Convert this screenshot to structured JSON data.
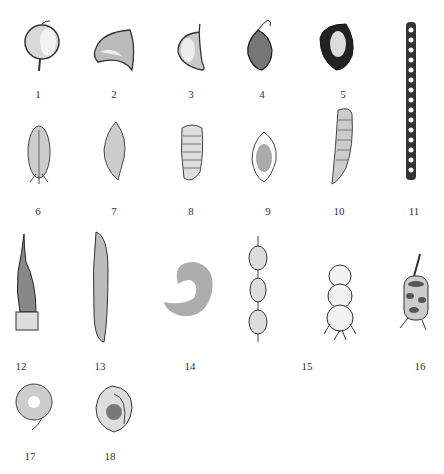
{
  "figure": {
    "type": "botanical-plate",
    "items": [
      {
        "label": "1",
        "shape": "globose pod with short stalk"
      },
      {
        "label": "2",
        "shape": "inflated hood-shaped pod"
      },
      {
        "label": "3",
        "shape": "half-ovoid pod with beak"
      },
      {
        "label": "4",
        "shape": "ovoid striated pod with curled beak"
      },
      {
        "label": "5",
        "shape": "dark obovoid pod"
      },
      {
        "label": "6",
        "shape": "oblong pod with calyx"
      },
      {
        "label": "7",
        "shape": "fusiform pod"
      },
      {
        "label": "8",
        "shape": "oblong transversely ribbed pod"
      },
      {
        "label": "9",
        "shape": "winged elliptic pod"
      },
      {
        "label": "10",
        "shape": "curved cylindrical ribbed pod"
      },
      {
        "label": "11",
        "shape": "long linear moniliform pod"
      },
      {
        "label": "12",
        "shape": "beaked pod with calyx"
      },
      {
        "label": "13",
        "shape": "linear flat pod"
      },
      {
        "label": "14",
        "shape": "curved reniform pod"
      },
      {
        "label": "15",
        "shape": "loment (constricted between seeds)"
      },
      {
        "label": "",
        "shape": "bead-like inflated pod with calyx"
      },
      {
        "label": "16",
        "shape": "spirally coiled pod"
      },
      {
        "label": "17",
        "shape": "coiled disc pod"
      },
      {
        "label": "18",
        "shape": "snail-shaped coiled pod"
      }
    ]
  }
}
